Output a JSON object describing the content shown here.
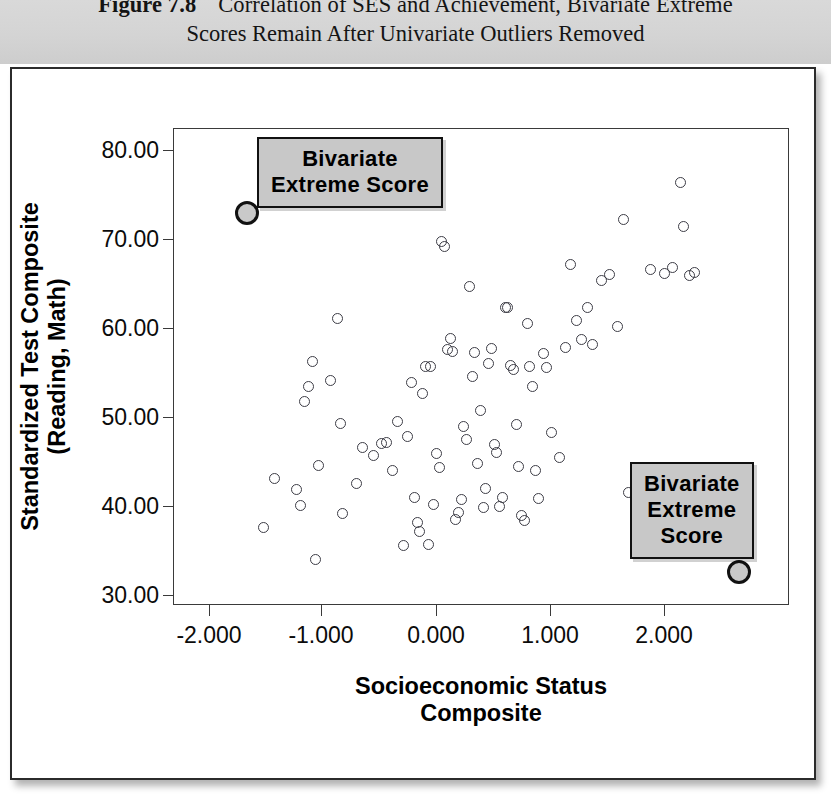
{
  "caption": {
    "figure_number": "Figure 7.8",
    "line1": "Correlation of SES and Achievement, Bivariate Extreme",
    "line2": "Scores Remain After Univariate Outliers Removed"
  },
  "annotations": {
    "top_left": {
      "line1": "Bivariate",
      "line2": "Extreme Score"
    },
    "bottom_right": {
      "line1": "Bivariate",
      "line2": "Extreme",
      "line3": "Score"
    }
  },
  "chart_data": {
    "type": "scatter",
    "title": "Correlation of SES and Achievement, Bivariate Extreme Scores Remain After Univariate Outliers Removed",
    "xlabel": "Socioeconomic Status Composite",
    "xlabel_line1": "Socioeconomic Status",
    "xlabel_line2": "Composite",
    "ylabel": "Standardized Test Composite (Reading, Math)",
    "ylabel_line1": "Standardized Test Composite",
    "ylabel_line2": "(Reading, Math)",
    "xlim": [
      -2.25,
      2.22
    ],
    "ylim": [
      27.8,
      82.5
    ],
    "xticks": [
      -2.0,
      -1.0,
      0.0,
      1.0,
      2.0
    ],
    "xticklabels": [
      "-2.000",
      "-1.000",
      "0.000",
      "1.000",
      "2.000"
    ],
    "yticks": [
      30,
      40,
      50,
      60,
      70,
      80
    ],
    "yticklabels": [
      "30.00",
      "40.00",
      "50.00",
      "60.00",
      "70.00",
      "80.00"
    ],
    "grid": false,
    "legend": false,
    "marker": "open-circle",
    "series": [
      {
        "name": "Students",
        "points": [
          [
            -1.6,
            36.6
          ],
          [
            -1.52,
            42.3
          ],
          [
            -1.36,
            41.0
          ],
          [
            -1.33,
            39.2
          ],
          [
            -1.3,
            51.1
          ],
          [
            -1.27,
            52.9
          ],
          [
            -1.24,
            55.7
          ],
          [
            -1.22,
            32.9
          ],
          [
            -1.2,
            43.7
          ],
          [
            -1.11,
            53.5
          ],
          [
            -1.06,
            60.7
          ],
          [
            -1.04,
            48.6
          ],
          [
            -1.02,
            38.2
          ],
          [
            -0.92,
            41.7
          ],
          [
            -0.88,
            45.8
          ],
          [
            -0.8,
            44.9
          ],
          [
            -0.74,
            46.3
          ],
          [
            -0.7,
            46.4
          ],
          [
            -0.66,
            43.2
          ],
          [
            -0.62,
            48.8
          ],
          [
            -0.58,
            34.5
          ],
          [
            -0.55,
            47.1
          ],
          [
            -0.52,
            53.3
          ],
          [
            -0.5,
            40.1
          ],
          [
            -0.48,
            37.2
          ],
          [
            -0.46,
            36.2
          ],
          [
            -0.44,
            52.0
          ],
          [
            -0.42,
            55.2
          ],
          [
            -0.4,
            34.7
          ],
          [
            -0.38,
            55.1
          ],
          [
            -0.36,
            39.3
          ],
          [
            -0.34,
            45.1
          ],
          [
            -0.32,
            43.5
          ],
          [
            -0.3,
            69.5
          ],
          [
            -0.28,
            69.0
          ],
          [
            -0.26,
            57.1
          ],
          [
            -0.24,
            58.4
          ],
          [
            -0.22,
            56.9
          ],
          [
            -0.2,
            37.5
          ],
          [
            -0.18,
            38.3
          ],
          [
            -0.16,
            39.8
          ],
          [
            -0.14,
            48.2
          ],
          [
            -0.12,
            46.8
          ],
          [
            -0.1,
            64.4
          ],
          [
            -0.08,
            54.0
          ],
          [
            -0.06,
            56.8
          ],
          [
            -0.04,
            44.0
          ],
          [
            -0.02,
            50.1
          ],
          [
            0.0,
            38.9
          ],
          [
            0.02,
            41.1
          ],
          [
            0.04,
            55.5
          ],
          [
            0.06,
            57.2
          ],
          [
            0.08,
            46.2
          ],
          [
            0.1,
            45.3
          ],
          [
            0.12,
            39.0
          ],
          [
            0.14,
            40.1
          ],
          [
            0.16,
            61.9
          ],
          [
            0.18,
            62.0
          ],
          [
            0.2,
            55.3
          ],
          [
            0.22,
            54.8
          ],
          [
            0.24,
            48.5
          ],
          [
            0.26,
            43.6
          ],
          [
            0.28,
            38.0
          ],
          [
            0.3,
            37.4
          ],
          [
            0.32,
            60.1
          ],
          [
            0.34,
            55.2
          ],
          [
            0.36,
            52.8
          ],
          [
            0.38,
            43.2
          ],
          [
            0.4,
            40.0
          ],
          [
            0.44,
            56.6
          ],
          [
            0.46,
            55.0
          ],
          [
            0.5,
            47.6
          ],
          [
            0.56,
            44.7
          ],
          [
            0.6,
            57.3
          ],
          [
            0.64,
            66.9
          ],
          [
            0.68,
            60.4
          ],
          [
            0.72,
            58.3
          ],
          [
            0.76,
            62.0
          ],
          [
            0.8,
            57.7
          ],
          [
            0.86,
            65.0
          ],
          [
            0.92,
            65.8
          ],
          [
            0.98,
            59.7
          ],
          [
            1.02,
            72.1
          ],
          [
            1.06,
            40.6
          ],
          [
            1.12,
            43.0
          ],
          [
            1.18,
            42.5
          ],
          [
            1.22,
            66.3
          ],
          [
            1.26,
            38.8
          ],
          [
            1.32,
            65.9
          ],
          [
            1.38,
            66.6
          ],
          [
            1.44,
            76.3
          ],
          [
            1.46,
            71.3
          ],
          [
            1.5,
            65.6
          ],
          [
            1.54,
            66.0
          ]
        ]
      }
    ],
    "highlighted_points": [
      {
        "x": -1.72,
        "y": 72.8,
        "label": "Bivariate Extreme Score"
      },
      {
        "x": 1.86,
        "y": 31.5,
        "label": "Bivariate Extreme Score"
      }
    ]
  }
}
